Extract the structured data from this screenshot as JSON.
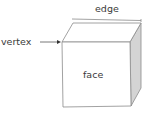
{
  "diagram": {
    "type": "labeled-cube",
    "labels": {
      "edge": "edge",
      "vertex": "vertex",
      "face": "face"
    },
    "colors": {
      "stroke": "#8a8a8a",
      "front_face": "#ffffff",
      "top_face": "#ffffff",
      "side_face": "#d4d4d4",
      "text": "#3a3a3a"
    }
  }
}
